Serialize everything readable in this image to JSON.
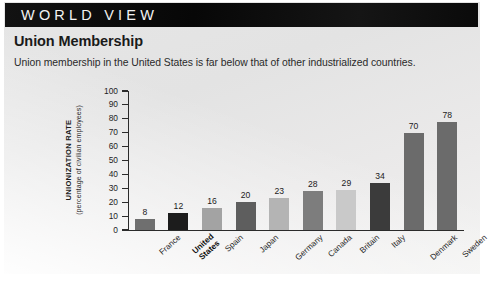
{
  "header": {
    "band_title": "WORLD VIEW",
    "band_color": "#0b0b0b",
    "band_text_color": "#f2f2f2"
  },
  "article": {
    "headline": "Union Membership",
    "deck": "Union membership in the United States is far below that of other industrialized countries."
  },
  "chart_data": {
    "type": "bar",
    "title": "Union Membership",
    "subtitle": "Union membership in the United States is far below that of other industrialized countries.",
    "xlabel": "",
    "ylabel": "UNIONIZATION RATE",
    "ylabel_sub": "(percentage of civilian employees)",
    "ylim": [
      0,
      100
    ],
    "ytick_step": 10,
    "yticks": [
      100,
      90,
      80,
      70,
      60,
      50,
      40,
      30,
      20,
      10,
      0
    ],
    "grid": false,
    "legend": "none",
    "categories": [
      "France",
      "United States",
      "Spain",
      "Japan",
      "Germany",
      "Canada",
      "Britain",
      "Italy",
      "Denmark",
      "Sweden"
    ],
    "values": [
      8,
      12,
      16,
      20,
      23,
      28,
      29,
      34,
      70,
      78
    ],
    "bar_colors": [
      "#6f6f6f",
      "#1c1c1c",
      "#a3a3a3",
      "#5e5e5e",
      "#b4b4b4",
      "#7d7d7d",
      "#c9c9c9",
      "#3b3b3b",
      "#6b6b6b",
      "#6b6b6b"
    ],
    "highlight_category": "United States"
  }
}
